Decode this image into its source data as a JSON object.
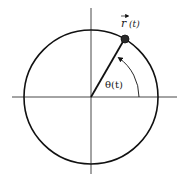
{
  "diagram": {
    "type": "unit-circle-position-vector",
    "center": [
      91,
      97
    ],
    "radius": 67,
    "angle_degrees": 60,
    "labels": {
      "vector": "r",
      "vector_arg": "(t)",
      "angle": "θ(t)"
    },
    "colors": {
      "stroke": "#111111",
      "axis": "#333333",
      "point": "#2a2a2a"
    }
  }
}
